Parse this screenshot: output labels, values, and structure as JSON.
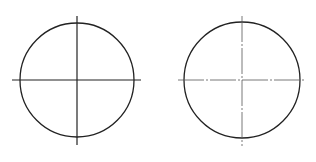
{
  "diagram": {
    "type": "technical-drawing",
    "colors": {
      "background": "#ffffff",
      "stroke": "#222222",
      "centerline": "#444444"
    },
    "figures": [
      {
        "id": "left",
        "description": "circle with solid centerlines",
        "circle": {
          "cx": 77,
          "cy": 80,
          "r": 57
        },
        "h_line": {
          "x1": 12,
          "x2": 141,
          "y": 80,
          "style": "solid"
        },
        "v_line": {
          "y1": 16,
          "y2": 145,
          "x": 77,
          "style": "solid"
        }
      },
      {
        "id": "right",
        "description": "circle with dash-dot centerlines",
        "circle": {
          "cx": 242,
          "cy": 80,
          "r": 58
        },
        "h_line": {
          "x1": 178,
          "x2": 305,
          "y": 80,
          "style": "dash-dot"
        },
        "v_line": {
          "y1": 16,
          "y2": 146,
          "x": 242,
          "style": "dash-dot"
        }
      }
    ]
  }
}
